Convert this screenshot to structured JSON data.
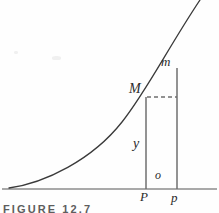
{
  "figure": {
    "caption": "FIGURE 12.7",
    "background_color": "#fefefe",
    "curve_color": "#3a3a3a",
    "axis_color": "#8d8d8d",
    "label_color": "#2b2b2b",
    "labels": {
      "upper_point_small": "m",
      "upper_point_capital": "M",
      "ordinate": "y",
      "increment": "o",
      "foot_capital": "P",
      "foot_small": "p"
    },
    "elements": {
      "axis_name": "horizontal-axis",
      "curve_name": "increasing-convex-curve",
      "ordinate_line_name": "ordinate-PM",
      "ordinate_line_2_name": "ordinate-pm",
      "dashed_line_name": "dashed-horizontal-from-M"
    }
  },
  "geometry": {
    "axis": {
      "x1": 2,
      "y1": 189,
      "x2": 217,
      "y2": 189
    },
    "curve_path": "M 9 188 C 45 183, 92 160, 122 122 C 146 92, 168 48, 200 0",
    "ordinate_P": {
      "x": 146,
      "y_top": 97,
      "y_bottom": 189
    },
    "ordinate_p": {
      "x": 177,
      "y_top": 68,
      "y_bottom": 189
    },
    "dashed": {
      "x1": 147,
      "y1": 97,
      "x2": 177,
      "y2": 97
    },
    "point_M": {
      "x": 146,
      "y": 97
    },
    "point_m": {
      "x": 177,
      "y": 68
    }
  }
}
